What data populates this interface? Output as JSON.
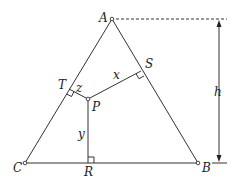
{
  "diagram": {
    "type": "geometry",
    "vertices": {
      "A": {
        "label": "A",
        "x": 112,
        "y": 19
      },
      "B": {
        "label": "B",
        "x": 198,
        "y": 163
      },
      "C": {
        "label": "C",
        "x": 25,
        "y": 163
      }
    },
    "interior_point": {
      "label": "P",
      "x": 88,
      "y": 99
    },
    "feet": {
      "T": {
        "label": "T",
        "x": 69,
        "y": 89
      },
      "S": {
        "label": "S",
        "x": 141,
        "y": 71
      },
      "R": {
        "label": "R",
        "x": 88,
        "y": 163
      }
    },
    "segments": {
      "PT": {
        "label": "z"
      },
      "PS": {
        "label": "x"
      },
      "PR": {
        "label": "y"
      }
    },
    "height": {
      "label": "h"
    }
  }
}
